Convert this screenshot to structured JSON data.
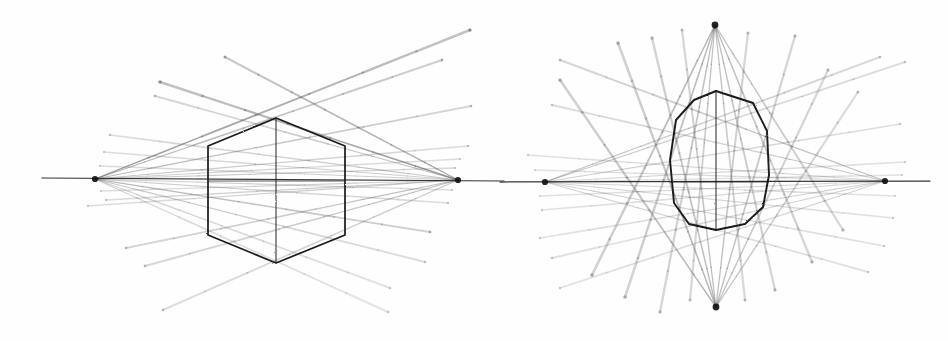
{
  "document": {
    "title": "Two-point and four-point perspective ray convergence diagrams",
    "background_color": "#fefefe",
    "width": 948,
    "height": 341,
    "medium": "pencil-style line drawing"
  },
  "figures": [
    {
      "id": "left-figure",
      "name": "two-point-perspective-diagram",
      "label": "",
      "center": {
        "x": 276,
        "y": 181
      },
      "core_shape": {
        "name": "hexagon",
        "sides": 6,
        "stroke_color": "#1a1a1a",
        "stroke_width": 1.7,
        "points": "276,118 345,146 345,235 276,263 208,235 208,146",
        "has_vertical_axis": true,
        "has_horizontal_axis": true
      },
      "vanishing_points": [
        {
          "name": "left-vanishing-point",
          "x": 95,
          "y": 179,
          "radius": 3.1
        },
        {
          "name": "right-vanishing-point",
          "x": 458,
          "y": 180,
          "radius": 3.1
        }
      ],
      "horizon_line": {
        "x1": 42,
        "y1": 178,
        "x2": 504,
        "y2": 181,
        "stroke_color": "#262626"
      }
    },
    {
      "id": "right-figure",
      "name": "four-point-perspective-diagram",
      "label": "",
      "center": {
        "x": 716,
        "y": 182
      },
      "core_shape": {
        "name": "rounded-octagon",
        "sides": 10,
        "stroke_color": "#1a1a1a",
        "stroke_width": 1.9,
        "points": "716,91 753,103 767,131 769,175 763,207 745,224 716,230 689,224 674,203 670,160 676,120 694,100",
        "has_vertical_axis": true,
        "has_horizontal_axis": true
      },
      "vanishing_points": [
        {
          "name": "left-vanishing-point",
          "x": 545,
          "y": 182,
          "radius": 3.1
        },
        {
          "name": "right-vanishing-point",
          "x": 885,
          "y": 181,
          "radius": 3.1
        },
        {
          "name": "top-vanishing-point",
          "x": 715,
          "y": 25,
          "radius": 3.4
        },
        {
          "name": "bottom-vanishing-point",
          "x": 716,
          "y": 307,
          "radius": 3.4
        }
      ],
      "horizon_line": {
        "x1": 500,
        "y1": 182,
        "x2": 930,
        "y2": 181,
        "stroke_color": "#262626"
      }
    }
  ],
  "chart_data": {
    "type": "scatter",
    "title": "",
    "xlabel": "",
    "ylabel": "",
    "left_figure_rays": [
      {
        "from": "left-vanishing-point",
        "to_x": 470,
        "to_y": 30,
        "opacity": 0.55,
        "width": 2.4
      },
      {
        "from": "left-vanishing-point",
        "to_x": 442,
        "to_y": 60,
        "opacity": 0.42,
        "width": 2.0
      },
      {
        "from": "left-vanishing-point",
        "to_x": 471,
        "to_y": 106,
        "opacity": 0.38,
        "width": 1.9
      },
      {
        "from": "left-vanishing-point",
        "to_x": 468,
        "to_y": 146,
        "opacity": 0.32,
        "width": 1.7
      },
      {
        "from": "left-vanishing-point",
        "to_x": 460,
        "to_y": 159,
        "opacity": 0.3,
        "width": 1.5
      },
      {
        "from": "left-vanishing-point",
        "to_x": 455,
        "to_y": 168,
        "opacity": 0.34,
        "width": 1.5
      },
      {
        "from": "left-vanishing-point",
        "to_x": 452,
        "to_y": 190,
        "opacity": 0.3,
        "width": 1.5
      },
      {
        "from": "left-vanishing-point",
        "to_x": 448,
        "to_y": 203,
        "opacity": 0.32,
        "width": 1.6
      },
      {
        "from": "left-vanishing-point",
        "to_x": 430,
        "to_y": 232,
        "opacity": 0.4,
        "width": 2.0
      },
      {
        "from": "left-vanishing-point",
        "to_x": 425,
        "to_y": 262,
        "opacity": 0.3,
        "width": 1.9
      },
      {
        "from": "left-vanishing-point",
        "to_x": 390,
        "to_y": 288,
        "opacity": 0.26,
        "width": 1.9
      },
      {
        "from": "left-vanishing-point",
        "to_x": 388,
        "to_y": 312,
        "opacity": 0.24,
        "width": 2.0
      },
      {
        "from": "right-vanishing-point",
        "to_x": 160,
        "to_y": 82,
        "opacity": 0.55,
        "width": 2.5
      },
      {
        "from": "right-vanishing-point",
        "to_x": 225,
        "to_y": 57,
        "opacity": 0.48,
        "width": 2.2
      },
      {
        "from": "right-vanishing-point",
        "to_x": 155,
        "to_y": 96,
        "opacity": 0.36,
        "width": 1.8
      },
      {
        "from": "right-vanishing-point",
        "to_x": 110,
        "to_y": 135,
        "opacity": 0.32,
        "width": 1.7
      },
      {
        "from": "right-vanishing-point",
        "to_x": 104,
        "to_y": 152,
        "opacity": 0.3,
        "width": 1.5
      },
      {
        "from": "right-vanishing-point",
        "to_x": 100,
        "to_y": 166,
        "opacity": 0.3,
        "width": 1.5
      },
      {
        "from": "right-vanishing-point",
        "to_x": 101,
        "to_y": 191,
        "opacity": 0.3,
        "width": 1.5
      },
      {
        "from": "right-vanishing-point",
        "to_x": 106,
        "to_y": 200,
        "opacity": 0.32,
        "width": 1.6
      },
      {
        "from": "right-vanishing-point",
        "to_x": 88,
        "to_y": 206,
        "opacity": 0.3,
        "width": 1.6
      },
      {
        "from": "right-vanishing-point",
        "to_x": 126,
        "to_y": 248,
        "opacity": 0.36,
        "width": 1.9
      },
      {
        "from": "right-vanishing-point",
        "to_x": 145,
        "to_y": 266,
        "opacity": 0.34,
        "width": 2.0
      },
      {
        "from": "right-vanishing-point",
        "to_x": 163,
        "to_y": 310,
        "opacity": 0.3,
        "width": 2.0
      }
    ],
    "right_figure_rays": [
      {
        "from": "left-vanishing-point",
        "to_x": 880,
        "to_y": 57,
        "opacity": 0.34,
        "width": 1.9
      },
      {
        "from": "left-vanishing-point",
        "to_x": 905,
        "to_y": 62,
        "opacity": 0.3,
        "width": 1.9
      },
      {
        "from": "left-vanishing-point",
        "to_x": 900,
        "to_y": 124,
        "opacity": 0.28,
        "width": 1.7
      },
      {
        "from": "left-vanishing-point",
        "to_x": 905,
        "to_y": 162,
        "opacity": 0.26,
        "width": 1.6
      },
      {
        "from": "left-vanishing-point",
        "to_x": 902,
        "to_y": 175,
        "opacity": 0.26,
        "width": 1.5
      },
      {
        "from": "left-vanishing-point",
        "to_x": 895,
        "to_y": 196,
        "opacity": 0.26,
        "width": 1.5
      },
      {
        "from": "left-vanishing-point",
        "to_x": 893,
        "to_y": 218,
        "opacity": 0.26,
        "width": 1.6
      },
      {
        "from": "left-vanishing-point",
        "to_x": 884,
        "to_y": 246,
        "opacity": 0.26,
        "width": 1.7
      },
      {
        "from": "left-vanishing-point",
        "to_x": 868,
        "to_y": 272,
        "opacity": 0.26,
        "width": 1.8
      },
      {
        "from": "right-vanishing-point",
        "to_x": 560,
        "to_y": 60,
        "opacity": 0.36,
        "width": 2.0
      },
      {
        "from": "right-vanishing-point",
        "to_x": 552,
        "to_y": 105,
        "opacity": 0.3,
        "width": 1.8
      },
      {
        "from": "right-vanishing-point",
        "to_x": 528,
        "to_y": 155,
        "opacity": 0.26,
        "width": 1.6
      },
      {
        "from": "right-vanishing-point",
        "to_x": 535,
        "to_y": 170,
        "opacity": 0.26,
        "width": 1.5
      },
      {
        "from": "right-vanishing-point",
        "to_x": 540,
        "to_y": 196,
        "opacity": 0.26,
        "width": 1.5
      },
      {
        "from": "right-vanishing-point",
        "to_x": 542,
        "to_y": 210,
        "opacity": 0.26,
        "width": 1.6
      },
      {
        "from": "right-vanishing-point",
        "to_x": 540,
        "to_y": 238,
        "opacity": 0.26,
        "width": 1.7
      },
      {
        "from": "right-vanishing-point",
        "to_x": 552,
        "to_y": 258,
        "opacity": 0.26,
        "width": 1.8
      },
      {
        "from": "right-vanishing-point",
        "to_x": 560,
        "to_y": 288,
        "opacity": 0.26,
        "width": 1.8
      },
      {
        "from": "top-vanishing-point",
        "to_x": 592,
        "to_y": 275,
        "opacity": 0.4,
        "width": 2.6
      },
      {
        "from": "top-vanishing-point",
        "to_x": 625,
        "to_y": 297,
        "opacity": 0.38,
        "width": 2.6
      },
      {
        "from": "top-vanishing-point",
        "to_x": 660,
        "to_y": 312,
        "opacity": 0.36,
        "width": 2.4
      },
      {
        "from": "top-vanishing-point",
        "to_x": 690,
        "to_y": 300,
        "opacity": 0.34,
        "width": 2.2
      },
      {
        "from": "top-vanishing-point",
        "to_x": 745,
        "to_y": 300,
        "opacity": 0.34,
        "width": 2.2
      },
      {
        "from": "top-vanishing-point",
        "to_x": 775,
        "to_y": 290,
        "opacity": 0.36,
        "width": 2.3
      },
      {
        "from": "top-vanishing-point",
        "to_x": 812,
        "to_y": 262,
        "opacity": 0.36,
        "width": 2.4
      },
      {
        "from": "top-vanishing-point",
        "to_x": 843,
        "to_y": 230,
        "opacity": 0.34,
        "width": 2.3
      },
      {
        "from": "bottom-vanishing-point",
        "to_x": 560,
        "to_y": 80,
        "opacity": 0.4,
        "width": 2.6
      },
      {
        "from": "bottom-vanishing-point",
        "to_x": 618,
        "to_y": 43,
        "opacity": 0.4,
        "width": 2.6
      },
      {
        "from": "bottom-vanishing-point",
        "to_x": 652,
        "to_y": 38,
        "opacity": 0.38,
        "width": 2.4
      },
      {
        "from": "bottom-vanishing-point",
        "to_x": 682,
        "to_y": 30,
        "opacity": 0.36,
        "width": 2.2
      },
      {
        "from": "bottom-vanishing-point",
        "to_x": 748,
        "to_y": 33,
        "opacity": 0.36,
        "width": 2.2
      },
      {
        "from": "bottom-vanishing-point",
        "to_x": 795,
        "to_y": 36,
        "opacity": 0.36,
        "width": 2.3
      },
      {
        "from": "bottom-vanishing-point",
        "to_x": 828,
        "to_y": 70,
        "opacity": 0.34,
        "width": 2.3
      },
      {
        "from": "bottom-vanishing-point",
        "to_x": 858,
        "to_y": 92,
        "opacity": 0.32,
        "width": 2.2
      }
    ]
  }
}
